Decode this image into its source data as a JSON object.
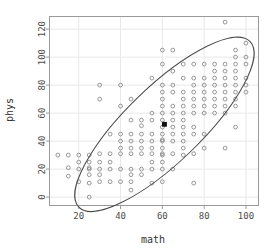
{
  "chart_data": {
    "type": "scatter",
    "title": "",
    "xlabel": "math",
    "ylabel": "phys",
    "xlim": [
      6,
      106
    ],
    "ylim": [
      -6,
      129
    ],
    "xticks": [
      20,
      40,
      60,
      80,
      100
    ],
    "yticks": [
      0,
      20,
      40,
      60,
      80,
      100,
      120
    ],
    "grid": true,
    "legend": "none",
    "marker": "open-circle",
    "marker_color": "#777777",
    "points": [
      [
        10,
        30
      ],
      [
        15,
        30
      ],
      [
        15,
        21
      ],
      [
        15,
        15
      ],
      [
        20,
        30
      ],
      [
        20,
        25
      ],
      [
        20,
        20
      ],
      [
        20,
        11
      ],
      [
        25,
        30
      ],
      [
        25,
        25
      ],
      [
        25,
        21
      ],
      [
        25,
        20
      ],
      [
        25,
        16
      ],
      [
        25,
        10
      ],
      [
        25,
        0
      ],
      [
        30,
        80
      ],
      [
        30,
        70
      ],
      [
        30,
        31
      ],
      [
        30,
        25
      ],
      [
        30,
        20
      ],
      [
        30,
        16
      ],
      [
        30,
        11
      ],
      [
        35,
        45
      ],
      [
        35,
        31
      ],
      [
        35,
        25
      ],
      [
        35,
        20
      ],
      [
        35,
        11
      ],
      [
        40,
        80
      ],
      [
        40,
        65
      ],
      [
        40,
        45
      ],
      [
        40,
        40
      ],
      [
        40,
        35
      ],
      [
        40,
        31
      ],
      [
        40,
        20
      ],
      [
        40,
        11
      ],
      [
        45,
        70
      ],
      [
        45,
        55
      ],
      [
        45,
        45
      ],
      [
        45,
        40
      ],
      [
        45,
        35
      ],
      [
        45,
        31
      ],
      [
        45,
        20
      ],
      [
        45,
        16
      ],
      [
        45,
        11
      ],
      [
        45,
        5
      ],
      [
        50,
        55
      ],
      [
        50,
        51
      ],
      [
        50,
        45
      ],
      [
        50,
        40
      ],
      [
        50,
        35
      ],
      [
        50,
        31
      ],
      [
        50,
        20
      ],
      [
        50,
        16
      ],
      [
        55,
        85
      ],
      [
        55,
        60
      ],
      [
        55,
        55
      ],
      [
        55,
        45
      ],
      [
        55,
        40
      ],
      [
        55,
        35
      ],
      [
        55,
        31
      ],
      [
        55,
        25
      ],
      [
        55,
        20
      ],
      [
        55,
        10
      ],
      [
        60,
        105
      ],
      [
        60,
        95
      ],
      [
        60,
        80
      ],
      [
        60,
        75
      ],
      [
        60,
        70
      ],
      [
        60,
        65
      ],
      [
        60,
        60
      ],
      [
        60,
        55
      ],
      [
        60,
        50
      ],
      [
        60,
        45
      ],
      [
        60,
        41
      ],
      [
        60,
        40
      ],
      [
        60,
        35
      ],
      [
        60,
        31
      ],
      [
        60,
        30
      ],
      [
        60,
        25
      ],
      [
        60,
        20
      ],
      [
        60,
        11
      ],
      [
        61,
        52
      ],
      [
        65,
        105
      ],
      [
        65,
        90
      ],
      [
        65,
        80
      ],
      [
        65,
        75
      ],
      [
        65,
        65
      ],
      [
        65,
        60
      ],
      [
        65,
        55
      ],
      [
        65,
        50
      ],
      [
        65,
        45
      ],
      [
        65,
        40
      ],
      [
        65,
        31
      ],
      [
        65,
        20
      ],
      [
        70,
        95
      ],
      [
        70,
        85
      ],
      [
        70,
        75
      ],
      [
        70,
        70
      ],
      [
        70,
        65
      ],
      [
        70,
        60
      ],
      [
        70,
        55
      ],
      [
        70,
        50
      ],
      [
        70,
        45
      ],
      [
        70,
        40
      ],
      [
        70,
        35
      ],
      [
        70,
        30
      ],
      [
        75,
        95
      ],
      [
        75,
        85
      ],
      [
        75,
        80
      ],
      [
        75,
        75
      ],
      [
        75,
        70
      ],
      [
        75,
        65
      ],
      [
        75,
        60
      ],
      [
        75,
        50
      ],
      [
        75,
        45
      ],
      [
        75,
        31
      ],
      [
        75,
        10
      ],
      [
        80,
        95
      ],
      [
        80,
        85
      ],
      [
        80,
        80
      ],
      [
        80,
        75
      ],
      [
        80,
        70
      ],
      [
        80,
        65
      ],
      [
        80,
        60
      ],
      [
        80,
        45
      ],
      [
        80,
        35
      ],
      [
        85,
        95
      ],
      [
        85,
        90
      ],
      [
        85,
        85
      ],
      [
        85,
        80
      ],
      [
        85,
        75
      ],
      [
        85,
        70
      ],
      [
        85,
        65
      ],
      [
        85,
        60
      ],
      [
        90,
        125
      ],
      [
        90,
        95
      ],
      [
        90,
        90
      ],
      [
        90,
        85
      ],
      [
        90,
        80
      ],
      [
        90,
        75
      ],
      [
        90,
        70
      ],
      [
        90,
        65
      ],
      [
        90,
        60
      ],
      [
        90,
        35
      ],
      [
        95,
        105
      ],
      [
        95,
        100
      ],
      [
        95,
        95
      ],
      [
        95,
        90
      ],
      [
        95,
        85
      ],
      [
        95,
        80
      ],
      [
        95,
        75
      ],
      [
        95,
        70
      ],
      [
        95,
        65
      ],
      [
        95,
        50
      ],
      [
        100,
        110
      ],
      [
        100,
        100
      ],
      [
        100,
        95
      ],
      [
        100,
        85
      ],
      [
        100,
        80
      ],
      [
        100,
        75
      ]
    ],
    "centroid": {
      "x": 61,
      "y": 52,
      "marker": "filled-square",
      "color": "#111111"
    },
    "ellipse": {
      "center_x": 61,
      "center_y": 52,
      "semi_major": 57,
      "semi_minor": 27,
      "rotation_deg": 44,
      "color": "#4a4a4a"
    }
  },
  "axes": {
    "x_title": "math",
    "y_title": "phys",
    "x_tick_labels": [
      "20",
      "40",
      "60",
      "80",
      "100"
    ],
    "y_tick_labels": [
      "0",
      "20",
      "40",
      "60",
      "80",
      "100",
      "120"
    ]
  },
  "style": {
    "grid_color": "#e8e8e8",
    "frame_color": "#9a9a9a",
    "background": "#ffffff"
  }
}
